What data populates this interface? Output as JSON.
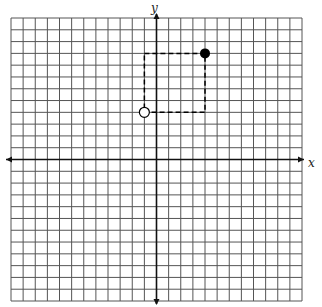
{
  "chart_data": {
    "type": "scatter",
    "title": "",
    "xlabel": "x",
    "ylabel": "y",
    "xlim": [
      -12,
      12
    ],
    "ylim": [
      -12,
      12
    ],
    "grid": true,
    "grid_step": 1,
    "points": [
      {
        "x": -1,
        "y": 4,
        "style": "open",
        "label": ""
      },
      {
        "x": 4,
        "y": 9,
        "style": "filled",
        "label": ""
      }
    ],
    "annotations": [
      {
        "type": "dashed-rectangle",
        "x1": -1,
        "y1": 4,
        "x2": 4,
        "y2": 9
      }
    ]
  },
  "axes": {
    "x_label": "x",
    "y_label": "y"
  },
  "colors": {
    "grid": "#555555",
    "axis": "#111111",
    "point": "#000000",
    "background": "#ffffff"
  }
}
